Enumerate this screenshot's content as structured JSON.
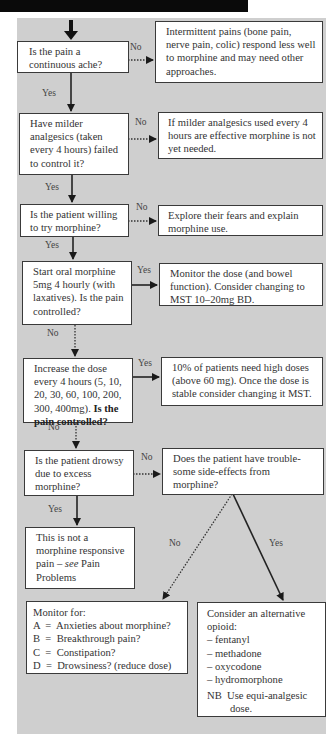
{
  "colors": {
    "background": "#cfcfcf",
    "box": "#ffffff",
    "line": "#2a2a2a",
    "topbar": "#0a0a0a"
  },
  "labels": {
    "yes": "Yes",
    "no": "No"
  },
  "steps": [
    {
      "id": "q1",
      "question": "Is the pain a continuous ache?",
      "no_text": "Intermittent pains (bone pain, nerve pain, colic) respond less well to morphine and may need other approaches."
    },
    {
      "id": "q2",
      "question": "Have milder analgesics (taken every 4 hours) failed to control it?",
      "no_text": "If milder analgesics used every 4 hours are effective morphine is not yet needed."
    },
    {
      "id": "q3",
      "question": "Is the patient willing to try morphine?",
      "no_text": "Explore their fears and explain morphine use."
    },
    {
      "id": "q4",
      "question": "Start oral morphine 5mg 4 hourly (with laxatives). Is the pain controlled?",
      "yes_text": "Monitor the dose (and bowel function). Consider changing to MST 10–20mg BD."
    },
    {
      "id": "q5",
      "question_plain": "Increase the dose every 4 hours (5, 10, 20, 30, 60, 100, 200, 300, 400mg).",
      "question_bold": "Is the pain controlled?",
      "yes_text": "10% of patients need high doses (above 60 mg). Once the dose is stable consider changing it MST."
    },
    {
      "id": "q6",
      "question": "Is the patient drowsy due to excess morphine?",
      "no_text": "Does the patient have trouble-some side-effects from morphine?"
    },
    {
      "id": "q7",
      "text_plain": "This is not a morphine responsive pain –",
      "text_italic": "see",
      "text_tail": "Pain Problems"
    }
  ],
  "monitor": {
    "title": "Monitor for:",
    "items": [
      "A  =  Anxieties about morphine?",
      "B  =  Breakthrough pain?",
      "C  =  Constipation?",
      "D  =  Drowsiness? (reduce dose)"
    ]
  },
  "alternative": {
    "title": "Consider an alternative opioid:",
    "items": [
      "– fentanyl",
      "– methadone",
      "– oxycodone",
      "– hydromorphone"
    ],
    "note": "NB  Use equi-analgesic dose."
  }
}
